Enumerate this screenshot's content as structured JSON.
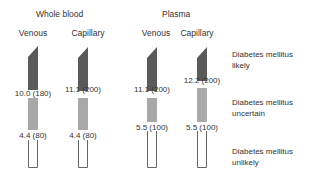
{
  "groups": [
    {
      "label": "Whole blood"
    },
    {
      "label": "Plasma"
    }
  ],
  "columns": [
    {
      "label": "Venous",
      "upper": "10.0 (180)",
      "lower": "4.4 (80)"
    },
    {
      "label": "Capillary",
      "upper": "11.1 (200)",
      "lower": "4.4 (80)"
    },
    {
      "label": "Venous",
      "upper": "11.1 (200)",
      "lower": "5.5 (100)"
    },
    {
      "label": "Capillary",
      "upper": "12.2 (200)",
      "lower": "5.5 (100)"
    }
  ],
  "legend": [
    {
      "line1": "Diabetes mellitus",
      "line2": "likely"
    },
    {
      "line1": "Diabetes mellitus",
      "line2": "uncertain"
    },
    {
      "line1": "Diabetes mellitus",
      "line2": "unlikely"
    }
  ],
  "colors": {
    "likely": "#5a5a5a",
    "uncertain": "#a9a9a9",
    "unlikely": "#ffffff"
  }
}
